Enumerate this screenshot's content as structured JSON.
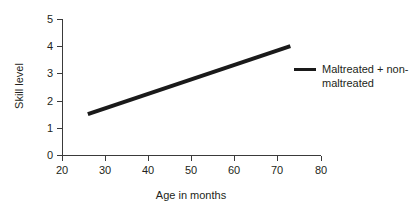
{
  "chart_data": {
    "type": "line",
    "title": "",
    "xlabel": "Age in months",
    "ylabel": "Skill level",
    "xlim": [
      20,
      80
    ],
    "ylim": [
      0,
      5
    ],
    "xticks": [
      "20",
      "30",
      "40",
      "50",
      "60",
      "70",
      "80"
    ],
    "yticks": [
      "0",
      "1",
      "2",
      "3",
      "4",
      "5"
    ],
    "grid": false,
    "legend_position": "right",
    "series": [
      {
        "name": "Maltreated + non-maltreated",
        "name_line1": "Maltreated + non-",
        "name_line2": "maltreated",
        "color": "#1a1a1a",
        "linewidth": 4,
        "x": [
          26,
          73
        ],
        "values": [
          1.5,
          4.0
        ]
      }
    ]
  },
  "colors": {
    "line": "#1a1a1a",
    "axis": "#3a3a3a",
    "text": "#231f20",
    "background": "#ffffff"
  }
}
